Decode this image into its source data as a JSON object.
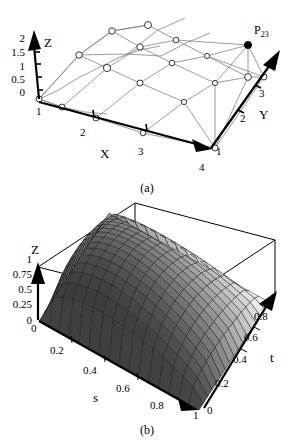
{
  "figure": {
    "background_color": "#ffffff",
    "line_color": "#000000",
    "net_color": "#7a7a7a"
  },
  "panel_a": {
    "caption": "(a)",
    "axes": {
      "x": {
        "name": "X",
        "ticks": [
          "1",
          "2",
          "3",
          "4"
        ]
      },
      "y": {
        "name": "Y",
        "ticks": [
          "1",
          "2",
          "3",
          "4"
        ]
      },
      "z": {
        "name": "Z",
        "ticks": [
          "0",
          "0.5",
          "1",
          "1.5",
          "2"
        ]
      }
    },
    "marked_point": {
      "label": "P",
      "subscript": "23"
    },
    "control_net": {
      "rows": 4,
      "columns": 4,
      "point_style": "open-circle",
      "marked_point_style": "filled-circle"
    }
  },
  "panel_b": {
    "caption": "(b)",
    "axes": {
      "s": {
        "name": "s",
        "ticks": [
          "0",
          "0.2",
          "0.4",
          "0.6",
          "0.8",
          "1"
        ]
      },
      "t": {
        "name": "t",
        "ticks": [
          "0",
          "0.2",
          "0.4",
          "0.6",
          "0.8",
          "1"
        ]
      },
      "z": {
        "name": "Z",
        "ticks": [
          "0",
          "0.25",
          "0.5",
          "0.75",
          "1"
        ]
      }
    },
    "surface": {
      "type": "mesh-surface",
      "shading": "grayscale-dither",
      "grid_u": 16,
      "grid_v": 16
    }
  },
  "chart_data": {
    "type": "surface",
    "title": "",
    "panels": [
      {
        "id": "a",
        "caption": "(a)",
        "type": "scatter",
        "description": "Bezier surface control net with 4x4 control points",
        "xlabel": "X",
        "ylabel": "Y",
        "zlabel": "Z",
        "xlim": [
          1,
          4
        ],
        "ylim": [
          1,
          4
        ],
        "zlim": [
          0,
          2
        ],
        "xticks": [
          1,
          2,
          3,
          4
        ],
        "yticks": [
          1,
          2,
          3,
          4
        ],
        "zticks": [
          0,
          0.5,
          1,
          1.5,
          2
        ],
        "grid": false,
        "legend": "none",
        "annotations": [
          {
            "text": "P23",
            "x": 2,
            "y": 3,
            "z": 2.0
          }
        ],
        "control_points_z": [
          [
            0.0,
            0.6,
            1.0,
            0.5
          ],
          [
            0.6,
            1.3,
            1.6,
            1.0
          ],
          [
            1.0,
            1.7,
            2.0,
            1.2
          ],
          [
            0.5,
            1.0,
            1.2,
            0.4
          ]
        ]
      },
      {
        "id": "b",
        "caption": "(b)",
        "type": "surface",
        "description": "Rendered Bezier surface patch over parametric domain",
        "xlabel": "s",
        "ylabel": "t",
        "zlabel": "Z",
        "xlim": [
          0,
          1
        ],
        "ylim": [
          0,
          1
        ],
        "zlim": [
          0,
          1
        ],
        "xticks": [
          0,
          0.2,
          0.4,
          0.6,
          0.8,
          1
        ],
        "yticks": [
          0,
          0.2,
          0.4,
          0.6,
          0.8,
          1
        ],
        "zticks": [
          0,
          0.25,
          0.5,
          0.75,
          1
        ],
        "grid": false,
        "legend": "none"
      }
    ]
  }
}
